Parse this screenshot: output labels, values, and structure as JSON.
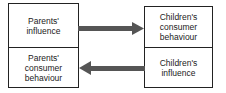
{
  "diagram": {
    "left_column": [
      {
        "id": "parents-influence",
        "label": "Parents'\ninfluence"
      },
      {
        "id": "parents-consumer-behaviour",
        "label": "Parents'\nconsumer\nbehaviour"
      }
    ],
    "right_column": [
      {
        "id": "childrens-consumer-behaviour",
        "label": "Children's\nconsumer\nbehaviour"
      },
      {
        "id": "childrens-influence",
        "label": "Children's\ninfluence"
      }
    ],
    "arrows": [
      {
        "from": "parents-influence",
        "to": "childrens-consumer-behaviour",
        "direction": "right"
      },
      {
        "from": "childrens-influence",
        "to": "parents-consumer-behaviour",
        "direction": "left"
      }
    ],
    "colors": {
      "border": "#222222",
      "arrow": "#555555",
      "text": "#222222"
    }
  }
}
